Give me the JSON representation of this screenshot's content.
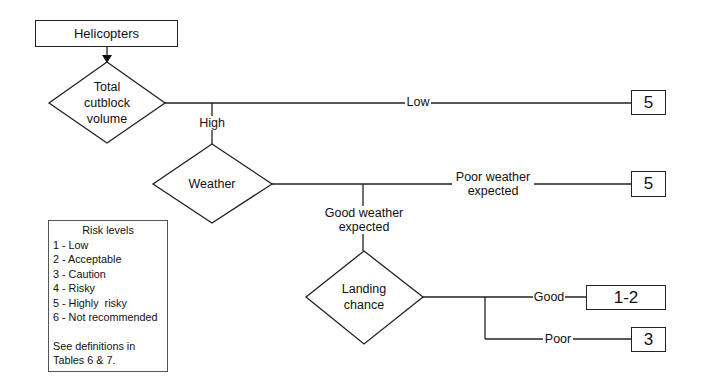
{
  "diagram": {
    "start": {
      "label": "Helicopters"
    },
    "decisions": [
      {
        "id": "volume",
        "label_lines": [
          "Total",
          "cutblock",
          "volume"
        ]
      },
      {
        "id": "weather",
        "label_lines": [
          "Weather"
        ]
      },
      {
        "id": "landing",
        "label_lines": [
          "Landing",
          "chance"
        ]
      }
    ],
    "edges": {
      "low": "Low",
      "high": "High",
      "poor_weather": [
        "Poor weather",
        "expected"
      ],
      "good_weather": [
        "Good weather",
        "expected"
      ],
      "good": "Good",
      "poor": "Poor"
    },
    "outcomes": {
      "low_volume": "5",
      "poor_weather": "5",
      "good_landing": "1-2",
      "poor_landing": "3"
    }
  },
  "legend": {
    "title": "Risk levels",
    "items": [
      "1 - Low",
      "2 - Acceptable",
      "3 - Caution",
      "4 - Risky",
      "5 - Highly  risky",
      "6 - Not recommended"
    ],
    "note_lines": [
      "See definitions in",
      "Tables 6 & 7."
    ]
  }
}
